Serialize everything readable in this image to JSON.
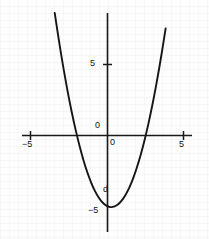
{
  "figure": {
    "background_color": "#fdfdfd",
    "ink_color": "#161616",
    "width": 209,
    "height": 239
  },
  "labels": {
    "y_axis_five": "5",
    "y_axis_zero": "0",
    "x_axis_zero": "0",
    "x_axis_neg_five": "−5",
    "x_axis_pos_five": "5",
    "y_axis_neg_five": "−5",
    "annotation_d": "d"
  },
  "chart_data": {
    "type": "line",
    "title": "",
    "xlabel": "",
    "ylabel": "",
    "xlim": [
      -5.6,
      5.6
    ],
    "ylim": [
      -5.9,
      8.6
    ],
    "grid": false,
    "legend": null,
    "axes": {
      "x_axis_y_value": 0,
      "y_axis_x_value": 0,
      "x_ticks": [
        -5,
        0,
        5
      ],
      "x_tick_labels": [
        "−5",
        "0",
        "5"
      ],
      "y_ticks": [
        -5,
        0,
        5
      ],
      "y_tick_labels": [
        "−5",
        "0",
        "5"
      ]
    },
    "annotations": [
      {
        "text": "d",
        "x": -0.15,
        "y": -3.6
      }
    ],
    "series": [
      {
        "name": "parabola",
        "equation": "y = x^2 - 0.5x - 5",
        "vertex": [
          0.25,
          -5.06
        ],
        "roots": [
          -1.6,
          2.1
        ],
        "y_intercept": -5,
        "x": [
          -3.7,
          -3.45,
          -3.2,
          -2.95,
          -2.7,
          -2.45,
          -2.2,
          -1.95,
          -1.7,
          -1.45,
          -1.2,
          -0.95,
          -0.7,
          -0.45,
          -0.2,
          0.05,
          0.3,
          0.55,
          0.8,
          1.05,
          1.3,
          1.55,
          1.8,
          2.05,
          2.3,
          2.55,
          2.8,
          3.05,
          3.3,
          3.55,
          3.8,
          4.0
        ],
        "y": [
          10.54,
          8.63,
          6.84,
          5.18,
          3.64,
          2.23,
          0.94,
          -0.22,
          -1.26,
          -2.18,
          -2.96,
          -3.63,
          -4.16,
          -4.58,
          -4.86,
          -5.02,
          -5.06,
          -4.97,
          -4.76,
          -4.42,
          -3.96,
          -3.38,
          -2.66,
          -1.82,
          -0.86,
          0.23,
          1.44,
          2.78,
          4.24,
          5.83,
          7.54,
          9.0
        ]
      }
    ]
  }
}
